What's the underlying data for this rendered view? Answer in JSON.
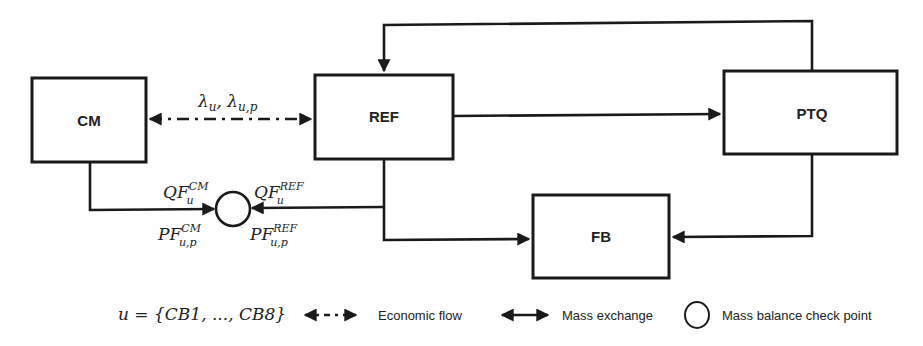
{
  "nodes": {
    "cm": {
      "label": "CM"
    },
    "ref": {
      "label": "REF"
    },
    "ptq": {
      "label": "PTQ"
    },
    "fb": {
      "label": "FB"
    }
  },
  "economic_link": {
    "label_main": "λ",
    "label_sub1": "u",
    "label_sep": ", ",
    "label_main2": "λ",
    "label_sub2": "u,p"
  },
  "check_point": {
    "cm_quantity": {
      "base": "QF",
      "sup": "CM",
      "sub": "u"
    },
    "ref_quantity": {
      "base": "QF",
      "sup": "REF",
      "sub": "u"
    },
    "cm_price": {
      "base": "PF",
      "sup": "CM",
      "sub": "u,p"
    },
    "ref_price": {
      "base": "PF",
      "sup": "REF",
      "sub": "u,p"
    }
  },
  "legend": {
    "set_definition": "u = {CB1, ..., CB8}",
    "economic_flow": "Economic flow",
    "mass_exchange": "Mass exchange",
    "mass_balance": "Mass balance check point"
  },
  "colors": {
    "stroke": "#1a1a1a",
    "background": "#ffffff"
  }
}
